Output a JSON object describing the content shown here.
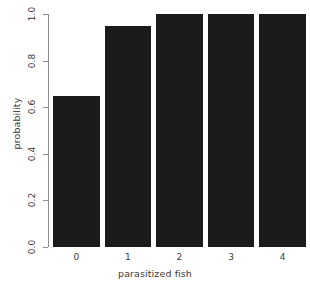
{
  "chart_data": {
    "type": "bar",
    "title": "",
    "xlabel": "parasitized fish",
    "ylabel": "probability",
    "categories": [
      "0",
      "1",
      "2",
      "3",
      "4"
    ],
    "values": [
      0.65,
      0.95,
      1.0,
      1.0,
      1.0
    ],
    "ylim": [
      0.0,
      1.0
    ],
    "yticks": [
      0.0,
      0.2,
      0.4,
      0.6,
      0.8,
      1.0
    ],
    "ytick_labels": [
      "0.0",
      "0.2",
      "0.4",
      "0.6",
      "0.8",
      "1.0"
    ],
    "grid": false,
    "legend": null,
    "bar_color": "#1b1b1b",
    "axis_color": "#8c8c8c",
    "text_color": "#3b3b3b",
    "background": "#ffffff"
  }
}
